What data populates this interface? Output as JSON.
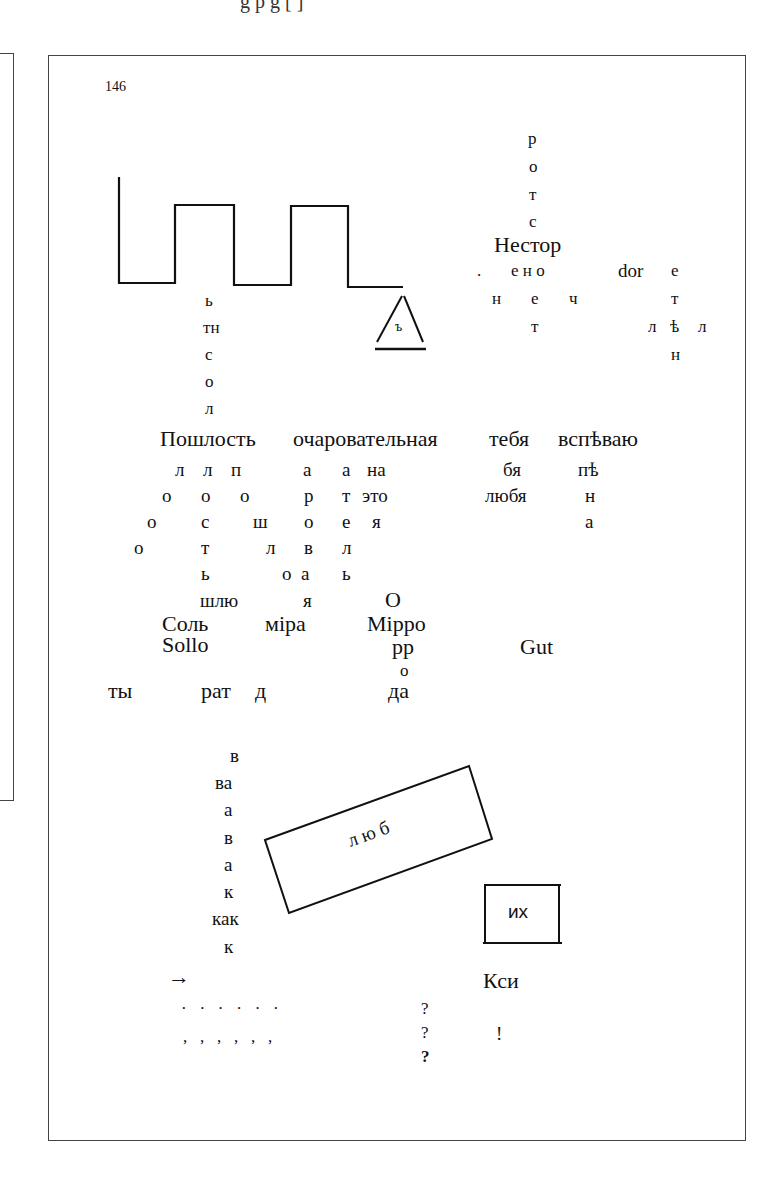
{
  "page": {
    "top_cut_text": "g p  g [ ]",
    "page_number": "146"
  },
  "poem": {
    "vertical_rotes": [
      "р",
      "о",
      "т",
      "с"
    ],
    "nestor": "Нестор",
    "dot": ".",
    "eno": "е н о",
    "n_e_ch": [
      "н",
      "е",
      "ч"
    ],
    "t1": "т",
    "dor": "dor",
    "right_col": [
      "е",
      "т",
      "ѣ",
      "н"
    ],
    "l_left": "л",
    "l_right": "л",
    "solnts_col": [
      "ь",
      "тн",
      "с",
      "о",
      "л"
    ],
    "triangle_letter": "ъ",
    "main_line": [
      "Пошлость",
      "очаровательная",
      "тебя",
      "вспѣваю"
    ],
    "rows": [
      [
        "л",
        "л",
        "п",
        "а",
        "а",
        "на",
        "бя",
        "пѣ"
      ],
      [
        "о",
        "о",
        "о",
        "р",
        "т",
        "это",
        "любя",
        "н"
      ],
      [
        "о",
        "с",
        "ш",
        "о",
        "е",
        "я",
        "а"
      ],
      [
        "о",
        "т",
        "л",
        "в",
        "л"
      ],
      [
        "ь",
        "о",
        "а",
        "ь"
      ],
      [
        "шлю",
        "я",
        "О"
      ]
    ],
    "sol": "Соль",
    "mira": "міра",
    "mirro": "Міррo",
    "sollo": "Sollo",
    "pp": "pp",
    "o_small": "о",
    "gut": "Gut",
    "ty": "ты",
    "rat": "рат",
    "d": "д",
    "da": "да",
    "vava_col": [
      "в",
      "ва",
      "а",
      "в",
      "а",
      "к",
      "как",
      "к"
    ],
    "lyub_box": "л ю б",
    "ikh_box": "их",
    "arrow": "→",
    "ksi": "Кси",
    "dots_row": "·   ·   ·   ·   ·   ·",
    "commas_row": ",   ,   ,   ,   ,   ,",
    "questions": [
      "?",
      "?",
      "?"
    ],
    "exclaim": "!"
  }
}
